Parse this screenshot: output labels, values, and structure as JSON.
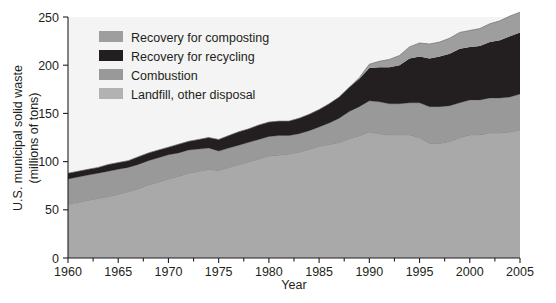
{
  "chart_data": {
    "type": "area",
    "title": "",
    "xlabel": "Year",
    "ylabel": "U.S. municipal solid waste (millions of tons)",
    "ylabel_line1": "U.S. municipal solid waste",
    "ylabel_line2": "(millions of tons)",
    "xlim": [
      1960,
      2005
    ],
    "ylim": [
      0,
      250
    ],
    "grid": false,
    "stacked": true,
    "legend_position": "top-left",
    "x_ticks": [
      1960,
      1965,
      1970,
      1975,
      1980,
      1985,
      1990,
      1995,
      2000,
      2005
    ],
    "x_tick_labels": [
      "1960",
      "1965",
      "1970",
      "1975",
      "1980",
      "1985",
      "1990",
      "1995",
      "2000",
      "2005"
    ],
    "x_minor_ticks": [
      1962.5,
      1967.5,
      1972.5,
      1977.5,
      1982.5,
      1987.5,
      1992.5,
      1997.5,
      2002.5
    ],
    "y_ticks": [
      0,
      50,
      100,
      150,
      200,
      250
    ],
    "y_tick_labels": [
      "0",
      "50",
      "100",
      "150",
      "200",
      "250"
    ],
    "x": [
      1960,
      1961,
      1962,
      1963,
      1964,
      1965,
      1966,
      1967,
      1968,
      1969,
      1970,
      1971,
      1972,
      1973,
      1974,
      1975,
      1976,
      1977,
      1978,
      1979,
      1980,
      1981,
      1982,
      1983,
      1984,
      1985,
      1986,
      1987,
      1988,
      1989,
      1990,
      1991,
      1992,
      1993,
      1994,
      1995,
      1996,
      1997,
      1998,
      1999,
      2000,
      2001,
      2002,
      2003,
      2004,
      2005
    ],
    "series": [
      {
        "name": "Landfill, other disposal",
        "color": "#a9a9a9",
        "stack_order": 1,
        "values": [
          56,
          58,
          60,
          62,
          64,
          66,
          69,
          72,
          76,
          79,
          82,
          85,
          88,
          90,
          92,
          91,
          94,
          97,
          100,
          103,
          106,
          107,
          108,
          110,
          113,
          116,
          118,
          120,
          124,
          127,
          131,
          129,
          128,
          128,
          128,
          125,
          119,
          119,
          121,
          125,
          128,
          128,
          130,
          130,
          131,
          133
        ]
      },
      {
        "name": "Combustion",
        "color": "#999999",
        "stack_order": 2,
        "values": [
          26,
          26,
          26,
          26,
          26,
          26,
          25,
          25,
          25,
          25,
          25,
          24,
          24,
          23,
          22,
          20,
          20,
          20,
          20,
          20,
          20,
          20,
          19,
          19,
          19,
          20,
          22,
          25,
          28,
          30,
          32,
          33,
          32,
          32,
          33,
          36,
          38,
          38,
          37,
          36,
          36,
          36,
          36,
          36,
          36,
          37
        ]
      },
      {
        "name": "Recovery for recycling",
        "color": "#231f20",
        "stack_order": 3,
        "values": [
          6,
          6,
          6,
          6,
          7,
          7,
          7,
          8,
          8,
          8,
          8,
          9,
          9,
          10,
          11,
          12,
          13,
          14,
          14,
          15,
          15,
          15,
          15,
          16,
          17,
          18,
          20,
          22,
          25,
          29,
          34,
          36,
          38,
          40,
          46,
          48,
          50,
          52,
          54,
          56,
          55,
          56,
          58,
          60,
          63,
          64
        ]
      },
      {
        "name": "Recovery for composting",
        "color": "#9e9e9e",
        "stack_order": 4,
        "values": [
          0,
          0,
          0,
          0,
          0,
          0,
          0,
          0,
          0,
          0,
          0,
          0,
          0,
          0,
          0,
          0,
          0,
          0,
          0,
          0,
          0,
          0,
          0,
          0,
          0,
          0,
          0,
          0,
          0,
          1,
          4,
          6,
          8,
          10,
          12,
          14,
          15,
          15,
          16,
          17,
          17,
          18,
          19,
          20,
          21,
          21
        ]
      }
    ],
    "totals": [
      88,
      90,
      92,
      94,
      97,
      99,
      101,
      105,
      109,
      112,
      115,
      118,
      121,
      123,
      125,
      123,
      127,
      131,
      134,
      138,
      141,
      142,
      142,
      145,
      149,
      154,
      160,
      167,
      177,
      187,
      201,
      204,
      206,
      210,
      219,
      223,
      222,
      224,
      228,
      234,
      236,
      238,
      243,
      246,
      251,
      255
    ]
  },
  "legend": {
    "items": [
      {
        "label": "Recovery for composting",
        "color": "#9e9e9e"
      },
      {
        "label": "Recovery for recycling",
        "color": "#231f20"
      },
      {
        "label": "Combustion",
        "color": "#999999"
      },
      {
        "label": "Landfill, other disposal",
        "color": "#b2b2b2"
      }
    ]
  },
  "colors": {
    "plot_background": "#f4f4f4",
    "page_background": "#ffffff",
    "axis": "#231f20",
    "text": "#231f20"
  }
}
